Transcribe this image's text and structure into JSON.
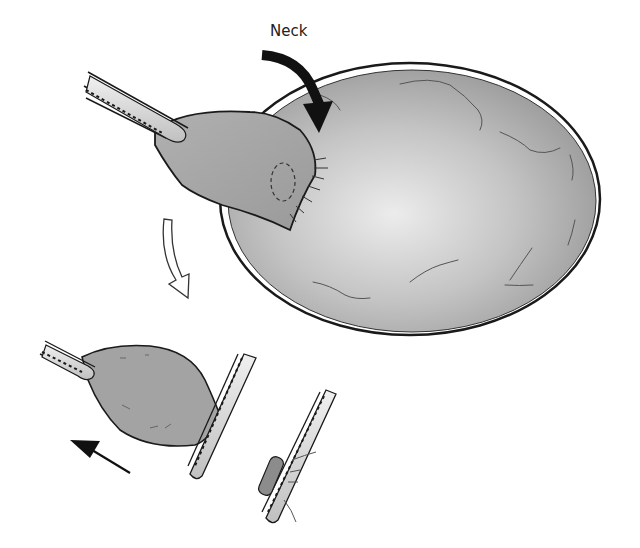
{
  "figure": {
    "labels": {
      "neck": "Neck"
    },
    "colors": {
      "sac_fill": "#a9a9a9",
      "sac_highlight": "#e6e6e6",
      "neck_fill": "#9c9c9c",
      "outline": "#1a1a1a",
      "tube_fill": "#d4d4d4",
      "arrow_solid": "#111111"
    },
    "parts": [
      "large-sac",
      "sac-neck",
      "catheter-upper",
      "outline-curved-arrow",
      "small-sac",
      "catheter-lower",
      "clip-tube",
      "retraction-arrow",
      "neck-arrow"
    ]
  }
}
